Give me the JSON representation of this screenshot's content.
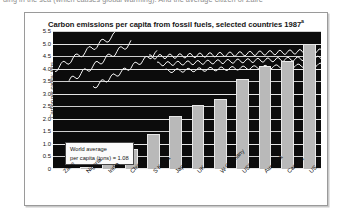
{
  "page": {
    "cutoff_text_above": "ding in the sea (which causes global warming). And the average citizen of Zaire"
  },
  "chart_data": {
    "type": "bar",
    "title": "Carbon emissions per capita from fossil fuels, selected countries 1987",
    "title_superscript": "a",
    "xlabel": "",
    "ylabel": "Carbon per capita: tons",
    "categories": [
      "Zaire",
      "Nigeria",
      "India",
      "China",
      "S Korea",
      "Japan",
      "UK",
      "W Germany",
      "USSR",
      "Australia",
      "Canada",
      "US"
    ],
    "values": [
      0.04,
      0.1,
      0.2,
      0.8,
      1.4,
      2.1,
      2.55,
      2.8,
      3.6,
      4.1,
      4.3,
      5.0
    ],
    "ylim": [
      0,
      5.5
    ],
    "ytick_labels": [
      "5.5",
      "5.0",
      "4.5",
      "4.0",
      "3.5",
      "3.0",
      "2.5",
      "2.0",
      "1.5",
      "1.0",
      "0.5",
      "0"
    ],
    "ytick_values": [
      5.5,
      5.0,
      4.5,
      4.0,
      3.5,
      3.0,
      2.5,
      2.0,
      1.5,
      1.0,
      0.5,
      0
    ],
    "grid": true,
    "legend": "none",
    "annotation": {
      "line1": "World average",
      "line2": "per capita (tons) = 1.08",
      "value": 1.08
    }
  }
}
